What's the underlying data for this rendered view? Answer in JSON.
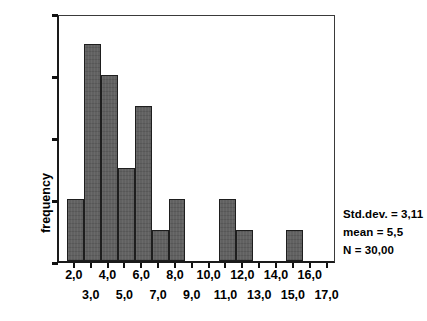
{
  "chart_data": {
    "type": "bar",
    "title": "",
    "xlabel": "",
    "ylabel": "frequency",
    "ylim": [
      0,
      8
    ],
    "xlim": [
      1.0,
      17.5
    ],
    "grid": false,
    "legend": null,
    "bin_width": 1.0,
    "categories": [
      "1,5-2,5",
      "2,5-3,5",
      "3,5-4,5",
      "4,5-5,5",
      "5,5-6,5",
      "6,5-7,5",
      "7,5-8,5",
      "8,5-9,5",
      "9,5-10,5",
      "10,5-11,5",
      "11,5-12,5",
      "12,5-13,5",
      "13,5-14,5",
      "14,5-15,5",
      "15,5-16,5"
    ],
    "bin_starts": [
      1.5,
      2.5,
      3.5,
      4.5,
      5.5,
      6.5,
      7.5,
      8.5,
      9.5,
      10.5,
      11.5,
      12.5,
      13.5,
      14.5,
      15.5
    ],
    "values": [
      2,
      7,
      6,
      3,
      5,
      1,
      2,
      0,
      0,
      2,
      1,
      0,
      0,
      1,
      0
    ],
    "y_ticks": [
      0,
      2,
      4,
      6,
      8
    ],
    "y_tick_labels": [
      "0",
      "2",
      "4",
      "6",
      "8"
    ],
    "x_ticks": [
      2,
      3,
      4,
      5,
      6,
      7,
      8,
      9,
      10,
      11,
      12,
      13,
      14,
      15,
      16,
      17
    ],
    "x_tick_labels": [
      "2,0",
      "3,0",
      "4,0",
      "5,0",
      "6,0",
      "7,0",
      "8,0",
      "9,0",
      "10,0",
      "11,0",
      "12,0",
      "13,0",
      "14,0",
      "15,0",
      "16,0",
      "17,0"
    ],
    "bar_color": "#5c5c5c",
    "bar_edge_color": "#1e1e1e",
    "axis_color": "#1a1a1a",
    "background_color": "#ffffff"
  },
  "statistics": {
    "std_dev": "Std.dev. = 3,11",
    "mean": "mean = 5,5",
    "n": "N = 30,00"
  }
}
